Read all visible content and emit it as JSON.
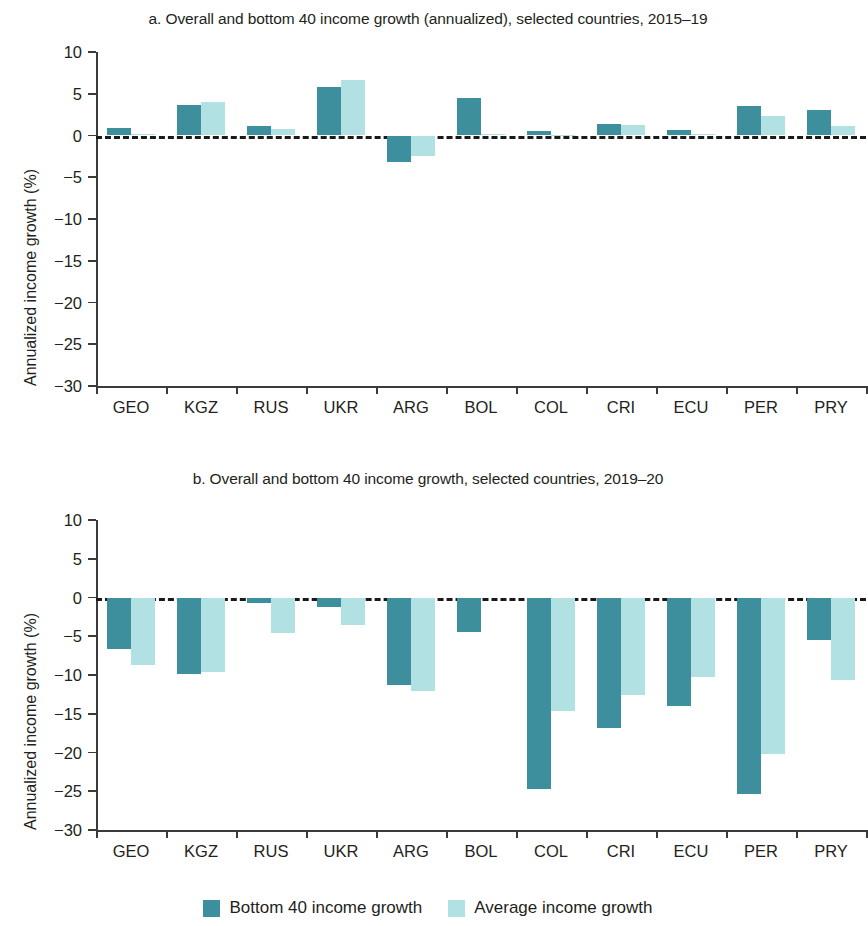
{
  "figure": {
    "legend": [
      {
        "label": "Bottom 40 income growth",
        "color": "#3d8f9e",
        "key": "bottom40"
      },
      {
        "label": "Average income growth",
        "color": "#b2e1e4",
        "key": "average"
      }
    ]
  },
  "chart_data": [
    {
      "type": "bar",
      "panel": "a",
      "title": "a. Overall and bottom 40 income growth (annualized), selected countries, 2015–19",
      "xlabel": "",
      "ylabel": "Annualized income growth (%)",
      "ylim": [
        -30,
        10
      ],
      "yticks": [
        10,
        5,
        0,
        -5,
        -10,
        -15,
        -20,
        -25,
        -30
      ],
      "ytick_labels": [
        "10",
        "5",
        "0",
        "−5",
        "−10",
        "−15",
        "−20",
        "−25",
        "−30"
      ],
      "grid": false,
      "zero_line": true,
      "legend_position": "bottom-center",
      "categories": [
        "GEO",
        "KGZ",
        "RUS",
        "UKR",
        "ARG",
        "BOL",
        "COL",
        "CRI",
        "ECU",
        "PER",
        "PRY"
      ],
      "series": [
        {
          "name": "Bottom 40 income growth",
          "color": "#3d8f9e",
          "values": [
            0.9,
            3.7,
            1.1,
            5.8,
            -3.2,
            4.5,
            0.5,
            1.4,
            0.6,
            3.5,
            3.0
          ]
        },
        {
          "name": "Average income growth",
          "color": "#b2e1e4",
          "values": [
            0.2,
            4.0,
            0.8,
            6.6,
            -2.4,
            0.2,
            0.1,
            1.3,
            0.2,
            2.3,
            1.1
          ]
        }
      ]
    },
    {
      "type": "bar",
      "panel": "b",
      "title": "b. Overall and bottom 40 income growth, selected countries, 2019–20",
      "xlabel": "",
      "ylabel": "Annualized income growth (%)",
      "ylim": [
        -30,
        10
      ],
      "yticks": [
        10,
        5,
        0,
        -5,
        -10,
        -15,
        -20,
        -25,
        -30
      ],
      "ytick_labels": [
        "10",
        "5",
        "0",
        "−5",
        "−10",
        "−15",
        "−20",
        "−25",
        "−30"
      ],
      "grid": false,
      "zero_line": true,
      "legend_position": "bottom-center",
      "categories": [
        "GEO",
        "KGZ",
        "RUS",
        "UKR",
        "ARG",
        "BOL",
        "COL",
        "CRI",
        "ECU",
        "PER",
        "PRY"
      ],
      "series": [
        {
          "name": "Bottom 40 income growth",
          "color": "#3d8f9e",
          "values": [
            -6.6,
            -9.9,
            -0.7,
            -1.2,
            -11.3,
            -4.4,
            -24.7,
            -16.9,
            -14.0,
            -25.4,
            -5.5
          ]
        },
        {
          "name": "Average income growth",
          "color": "#b2e1e4",
          "values": [
            -8.7,
            -9.6,
            -4.6,
            -3.6,
            -12.1,
            0.0,
            -14.7,
            -12.6,
            -10.2,
            -20.2,
            -10.6
          ]
        }
      ]
    }
  ]
}
